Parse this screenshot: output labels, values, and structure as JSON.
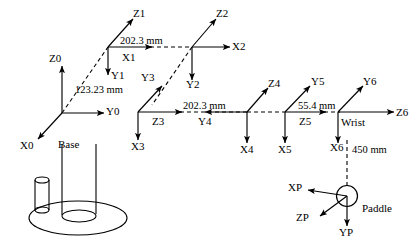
{
  "diagram": {
    "stroke_color": "#000000",
    "background_color": "#ffffff",
    "frames": [
      {
        "name": "frame-0",
        "labels": [
          "Z0",
          "Y0",
          "X0"
        ],
        "annotation": "Base"
      },
      {
        "name": "frame-1",
        "labels": [
          "Z1",
          "X1",
          "Y1"
        ]
      },
      {
        "name": "frame-2",
        "labels": [
          "Z2",
          "X2",
          "Y2"
        ]
      },
      {
        "name": "frame-3",
        "labels": [
          "Y3",
          "Z3",
          "X3"
        ]
      },
      {
        "name": "frame-4",
        "labels": [
          "Z4",
          "Y4",
          "X4"
        ]
      },
      {
        "name": "frame-5",
        "labels": [
          "Y5",
          "Z5",
          "X5"
        ]
      },
      {
        "name": "frame-6",
        "labels": [
          "Y6",
          "Z6",
          "X6"
        ],
        "annotation": "Wrist"
      },
      {
        "name": "frame-paddle",
        "labels": [
          "XP",
          "ZP",
          "YP"
        ],
        "annotation": "Paddle"
      }
    ],
    "axis_labels": {
      "z0": "Z0",
      "y0": "Y0",
      "x0": "X0",
      "z1": "Z1",
      "x1": "X1",
      "y1": "Y1",
      "z2": "Z2",
      "x2": "X2",
      "y2": "Y2",
      "y3": "Y3",
      "z3": "Z3",
      "x3": "X3",
      "z4": "Z4",
      "y4": "Y4",
      "x4": "X4",
      "y5": "Y5",
      "z5": "Z5",
      "x5": "X5",
      "y6": "Y6",
      "z6": "Z6",
      "x6": "X6",
      "xp": "XP",
      "zp": "ZP",
      "yp": "YP"
    },
    "annotations": {
      "base": "Base",
      "wrist": "Wrist",
      "paddle": "Paddle"
    },
    "dimensions": [
      {
        "name": "link-0-1",
        "text": "123.23 mm",
        "value": 123.23,
        "unit": "mm"
      },
      {
        "name": "link-1-2",
        "text": "202.3 mm",
        "value": 202.3,
        "unit": "mm"
      },
      {
        "name": "link-3-4",
        "text": "202.3 mm",
        "value": 202.3,
        "unit": "mm"
      },
      {
        "name": "link-5-6",
        "text": "55.4 mm",
        "value": 55.4,
        "unit": "mm"
      },
      {
        "name": "link-6-paddle",
        "text": "450 mm",
        "value": 450,
        "unit": "mm"
      }
    ],
    "dimension_text": {
      "d1": "123.23 mm",
      "d2": "202.3 mm",
      "d3": "202.3 mm",
      "d4": "55.4 mm",
      "d5": "450 mm"
    }
  }
}
